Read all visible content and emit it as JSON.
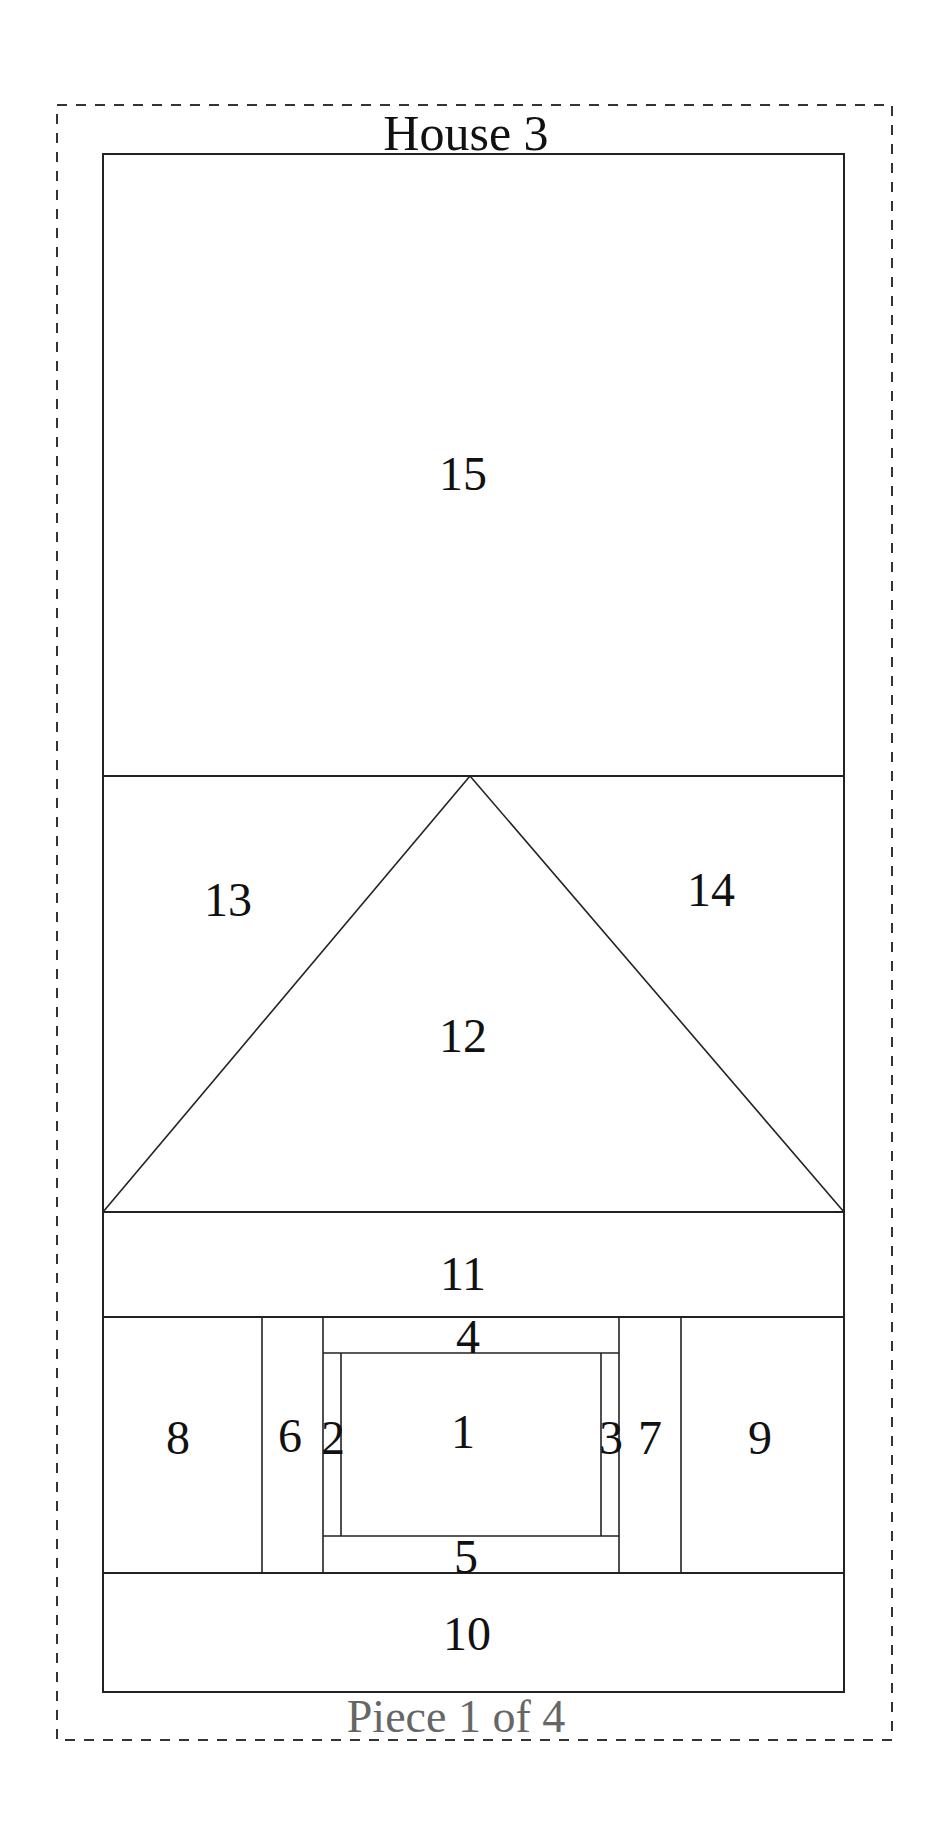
{
  "title": "House 3",
  "footer": "Piece 1 of 4",
  "colors": {
    "line": "#222222",
    "text": "#111111",
    "footer": "#666666",
    "background": "#ffffff"
  },
  "pieces": [
    {
      "id": "1",
      "label": "1"
    },
    {
      "id": "2",
      "label": "2"
    },
    {
      "id": "3",
      "label": "3"
    },
    {
      "id": "4",
      "label": "4"
    },
    {
      "id": "5",
      "label": "5"
    },
    {
      "id": "6",
      "label": "6"
    },
    {
      "id": "7",
      "label": "7"
    },
    {
      "id": "8",
      "label": "8"
    },
    {
      "id": "9",
      "label": "9"
    },
    {
      "id": "10",
      "label": "10"
    },
    {
      "id": "11",
      "label": "11"
    },
    {
      "id": "12",
      "label": "12"
    },
    {
      "id": "13",
      "label": "13"
    },
    {
      "id": "14",
      "label": "14"
    },
    {
      "id": "15",
      "label": "15"
    }
  ]
}
